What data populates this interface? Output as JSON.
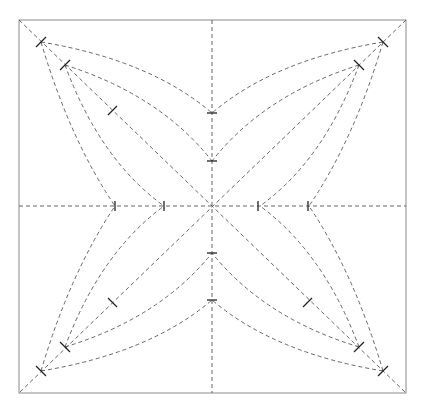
{
  "diagram": {
    "type": "crease-pattern",
    "colors": {
      "background": "#ffffff",
      "border": "#8a8a8a",
      "crease": "#555555",
      "tick": "#222222"
    },
    "square": {
      "x1": 19,
      "y1": 20,
      "x2": 406,
      "y2": 393
    },
    "center": {
      "x": 212,
      "y": 206
    },
    "line_style": "dashed",
    "tick_marks": 16
  }
}
